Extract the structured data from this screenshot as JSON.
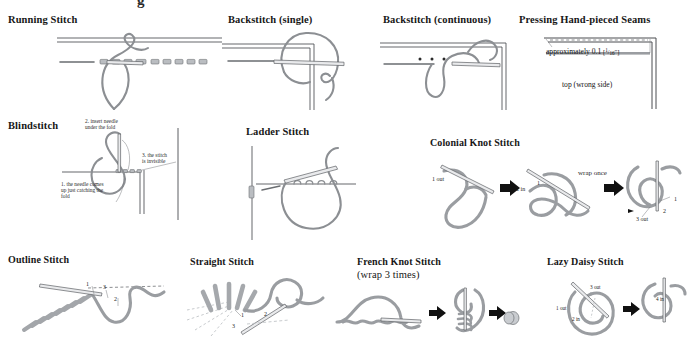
{
  "page": {
    "top_cut_glyph": "g",
    "background": "#ffffff",
    "thread_color": "#8c8f93",
    "line_color": "#4a4d51",
    "text_color": "#1a1a1a"
  },
  "panels": [
    {
      "id": "running-stitch",
      "title": "Running Stitch",
      "labels": []
    },
    {
      "id": "backstitch-single",
      "title": "Backstitch (single)",
      "labels": []
    },
    {
      "id": "backstitch-continuous",
      "title": "Backstitch (continuous)",
      "labels": []
    },
    {
      "id": "pressing-hand-pieced-seams",
      "title": "Pressing Hand-pieced Seams",
      "measure": "approximately 0.1 [¹/₁₆\"]",
      "measure_plain": "approximately 0.1",
      "measure_fraction_num": "1",
      "measure_fraction_den": "16",
      "measure_unit": "\"",
      "side_note": "top (wrong side)",
      "labels": []
    },
    {
      "id": "blindstitch",
      "title": "Blindstitch",
      "notes": [
        {
          "id": "note-2",
          "text": "2.  insert needle\nunder the fold"
        },
        {
          "id": "note-3",
          "text": "3.  the stitch\nis invisible"
        },
        {
          "id": "note-1",
          "text": "1.  the needle comes\nup just catching the\nfold"
        }
      ]
    },
    {
      "id": "ladder-stitch",
      "title": "Ladder Stitch",
      "labels": []
    },
    {
      "id": "colonial-knot-stitch",
      "title": "Colonial Knot Stitch",
      "labels": [
        {
          "id": "ck-1out",
          "text": "1  out"
        },
        {
          "id": "ck-2in",
          "text": "2 in"
        },
        {
          "id": "ck-1b",
          "text": "1"
        },
        {
          "id": "ck-wrap",
          "text": "wrap once"
        },
        {
          "id": "ck-1c",
          "text": "1"
        },
        {
          "id": "ck-2b",
          "text": "2"
        },
        {
          "id": "ck-3out",
          "text": "3  out"
        }
      ]
    },
    {
      "id": "outline-stitch",
      "title": "Outline Stitch",
      "labels": [
        {
          "id": "ol-1",
          "text": "1"
        },
        {
          "id": "ol-3",
          "text": "3"
        },
        {
          "id": "ol-2",
          "text": "2"
        }
      ]
    },
    {
      "id": "straight-stitch",
      "title": "Straight Stitch",
      "labels": [
        {
          "id": "st-1",
          "text": "1"
        },
        {
          "id": "st-2",
          "text": "2"
        },
        {
          "id": "st-3",
          "text": "3"
        }
      ]
    },
    {
      "id": "french-knot-stitch",
      "title": "French Knot Stitch",
      "subtitle": "(wrap 3 times)",
      "labels": []
    },
    {
      "id": "lazy-daisy-stitch",
      "title": "Lazy Daisy Stitch",
      "labels": [
        {
          "id": "ld-3out",
          "text": "3 out"
        },
        {
          "id": "ld-1out",
          "text": "1 out"
        },
        {
          "id": "ld-2in",
          "text": "2 in"
        },
        {
          "id": "ld-4in",
          "text": "4 in"
        }
      ]
    }
  ]
}
